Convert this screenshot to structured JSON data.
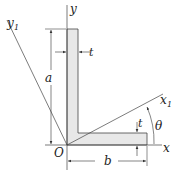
{
  "diagram": {
    "labels": {
      "y_axis": "y",
      "y1_axis": "y",
      "y1_sub": "1",
      "x_axis": "x",
      "x1_axis": "x",
      "x1_sub": "1",
      "origin": "O",
      "dim_a": "a",
      "dim_b": "b",
      "thickness_top": "t",
      "thickness_right": "t",
      "angle": "θ"
    },
    "colors": {
      "line": "#333333",
      "fill": "#e8e8e8"
    }
  }
}
